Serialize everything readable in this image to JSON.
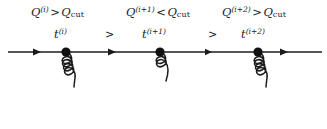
{
  "figure": {
    "type": "feynman-parton-shower-diagram",
    "background_color": "#ffffff",
    "stroke_color": "#1c1c1c"
  },
  "emissions": [
    {
      "id": "emission-1",
      "scale_label": {
        "variable": "Q",
        "superscript": "(i)",
        "relation": ">",
        "threshold": "Q",
        "threshold_subscript": "cut",
        "full_text": "Q(i) > Qcut"
      },
      "evolution_label": {
        "variable": "t",
        "superscript": "(i)",
        "full_text": "t(i)"
      },
      "vertex": {
        "x": 66,
        "y": 52
      },
      "gluon": {
        "loops": 4,
        "length": 73,
        "emitted": true
      }
    },
    {
      "id": "emission-2",
      "scale_label": {
        "variable": "Q",
        "superscript": "(i+1)",
        "relation": "<",
        "threshold": "Q",
        "threshold_subscript": "cut",
        "full_text": "Q(i+1) < Qcut"
      },
      "evolution_label": {
        "variable": "t",
        "superscript": "(i+1)",
        "full_text": "t(i+1)"
      },
      "vertex": {
        "x": 160,
        "y": 52
      },
      "gluon": {
        "loops": 2,
        "length": 45,
        "emitted": true
      }
    },
    {
      "id": "emission-3",
      "scale_label": {
        "variable": "Q",
        "superscript": "(i+2)",
        "relation": ">",
        "threshold": "Q",
        "threshold_subscript": "cut",
        "full_text": "Q(i+2) > Qcut"
      },
      "evolution_label": {
        "variable": "t",
        "superscript": "(i+2)",
        "full_text": "t(i+2)"
      },
      "vertex": {
        "x": 258,
        "y": 52
      },
      "gluon": {
        "loops": 4,
        "length": 73,
        "emitted": true
      }
    }
  ],
  "ordering_symbols": [
    {
      "id": "ordering-1",
      "symbol": ">"
    },
    {
      "id": "ordering-2",
      "symbol": ">"
    }
  ],
  "fermion_line": {
    "label": "parton-line",
    "x_start": 8,
    "x_end": 322,
    "y": 52,
    "arrow_positions": [
      38,
      113,
      210,
      285
    ]
  }
}
